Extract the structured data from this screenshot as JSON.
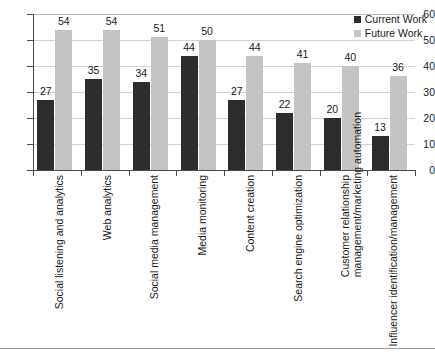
{
  "chart_data": {
    "type": "bar",
    "title": "",
    "xlabel": "",
    "ylabel": "",
    "ylim": [
      0,
      60
    ],
    "ytick_step": 10,
    "yticks": [
      0,
      10,
      20,
      30,
      40,
      50,
      60
    ],
    "grid": true,
    "legend_position": "top-right",
    "categories": [
      "Social listening and analytics",
      "Web analytics",
      "Social media management",
      "Media monitoring",
      "Content creation",
      "Search engine optimization",
      "Customer relationship management/marketing automation",
      "Influencer identification/management"
    ],
    "category_lines": [
      [
        "Social listening and analytics"
      ],
      [
        "Web analytics"
      ],
      [
        "Social media management"
      ],
      [
        "Media monitoring"
      ],
      [
        "Content creation"
      ],
      [
        "Search engine optimization"
      ],
      [
        "Customer relationship",
        "management/marketing automation"
      ],
      [
        "Influencer identification/management"
      ]
    ],
    "series": [
      {
        "name": "Current Work",
        "color": "#2d2d2d",
        "values": [
          27,
          35,
          34,
          44,
          27,
          22,
          20,
          13
        ]
      },
      {
        "name": "Future Work",
        "color": "#c4c4c4",
        "values": [
          54,
          54,
          51,
          50,
          44,
          41,
          40,
          36
        ]
      }
    ]
  },
  "legend": {
    "items": [
      {
        "label": "Current Work",
        "color": "#2d2d2d"
      },
      {
        "label": "Future Work",
        "color": "#c4c4c4"
      }
    ]
  },
  "axis": {
    "y_tick_labels": [
      "60",
      "50",
      "40",
      "30",
      "20",
      "10",
      "0"
    ]
  },
  "colors": {
    "current": "#2d2d2d",
    "future": "#c4c4c4",
    "grid": "#d3d3d3",
    "axis": "#4a4a4a",
    "text": "#1a1a1a",
    "background": "#ffffff"
  }
}
